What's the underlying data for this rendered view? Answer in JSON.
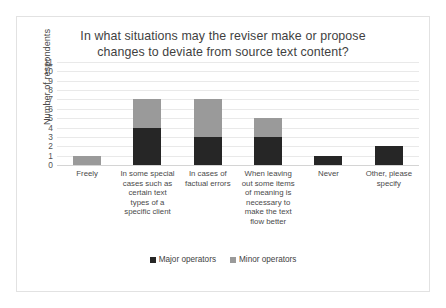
{
  "frame": {
    "border_color": "#e2e2e2"
  },
  "chart_data": {
    "type": "bar",
    "subtype": "stacked-column",
    "title": "In what situations may the reviser make or propose changes to deviate from source text content?",
    "title_lines": [
      "In what situations may the reviser make or propose",
      "changes to deviate from source text content?"
    ],
    "xlabel": "",
    "ylabel": "Number of respondents",
    "ylim": [
      0,
      11
    ],
    "yticks": [
      11,
      10,
      9,
      8,
      7,
      6,
      5,
      4,
      3,
      2,
      1,
      0
    ],
    "grid": true,
    "legend_position": "bottom",
    "categories": [
      "Freely",
      "In some special cases such as certain text types of a specific client",
      "In cases of factual errors",
      "When leaving out some items of meaning is necessary to make the text flow better",
      "Never",
      "Other, please specify"
    ],
    "category_label_lines": [
      [
        "Freely"
      ],
      [
        "In some special",
        "cases such as",
        "certain text",
        "types of a",
        "specific client"
      ],
      [
        "In cases of",
        "factual errors"
      ],
      [
        "When leaving",
        "out some items",
        "of meaning is",
        "necessary to",
        "make the text",
        "flow better"
      ],
      [
        "Never"
      ],
      [
        "Other, please",
        "specify"
      ]
    ],
    "series": [
      {
        "name": "Major operators",
        "color": "#262626",
        "values": [
          0,
          4,
          3,
          3,
          1,
          2
        ]
      },
      {
        "name": "Minor operators",
        "color": "#9a9a9a",
        "values": [
          1,
          3,
          4,
          2,
          0,
          0
        ]
      }
    ],
    "totals": [
      1,
      7,
      7,
      5,
      1,
      2
    ]
  },
  "legend": {
    "items": [
      {
        "label": "Major operators",
        "color": "#262626"
      },
      {
        "label": "Minor operators",
        "color": "#9a9a9a"
      }
    ]
  }
}
